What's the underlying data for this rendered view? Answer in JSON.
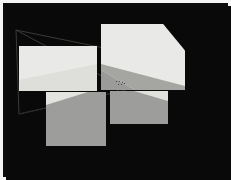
{
  "viewport": {
    "width": 231,
    "height": 180,
    "frame_color": "#f4f4f4",
    "background_color": "#090909"
  },
  "scene": {
    "title": "dark-scene-collage",
    "description": "Dark photographic scene with light and grey rectangular crop panels overlaid in a collage arrangement.",
    "wireframe_color": "#3a3a38"
  },
  "panels": [
    {
      "id": "panel-mid-left",
      "label": "mid-left-light-crop",
      "tone": "light",
      "fill": "#e9e9e7",
      "x": 16,
      "y": 43,
      "width": 78,
      "height": 45,
      "corner": "square"
    },
    {
      "id": "panel-top-right",
      "label": "top-right-light-crop",
      "tone": "light",
      "fill": "#e9e9e7",
      "x": 98,
      "y": 21,
      "width": 84,
      "height": 66,
      "corner": "chamfered-top-right"
    },
    {
      "id": "panel-bottom-left",
      "label": "bottom-left-grey-crop",
      "tone": "grey",
      "fill": "#9d9d9b",
      "x": 43,
      "y": 89,
      "width": 60,
      "height": 54,
      "corner": "square"
    },
    {
      "id": "panel-bottom-right",
      "label": "bottom-right-grey-crop",
      "tone": "grey",
      "fill": "#9d9d9b",
      "x": 107,
      "y": 88,
      "width": 58,
      "height": 33,
      "corner": "square"
    }
  ],
  "wedges": [
    {
      "id": "wedge-mid-left",
      "panel": "panel-mid-left",
      "fill": "#dcdcd8",
      "note": "soft diagonal shading across lower-right of panel"
    },
    {
      "id": "wedge-top-right-grey",
      "panel": "panel-top-right",
      "fill": "#9b9b99",
      "note": "grey triangular wedge entering bottom-left corner"
    },
    {
      "id": "wedge-bottom-left-light",
      "panel": "panel-bottom-left",
      "fill": "#e3e3df",
      "note": "light wedge occupying top-left corner"
    },
    {
      "id": "wedge-bottom-right-light",
      "panel": "panel-bottom-right",
      "fill": "#e0e0dc",
      "note": "light wedge occupying top-right corner"
    }
  ],
  "speckles": {
    "label": "central-marker-dots",
    "color": "#2e2e2e",
    "points": [
      {
        "x": 113,
        "y": 78
      },
      {
        "x": 116,
        "y": 78
      },
      {
        "x": 119,
        "y": 79
      },
      {
        "x": 115,
        "y": 81
      },
      {
        "x": 118,
        "y": 81
      },
      {
        "x": 121,
        "y": 80
      }
    ]
  }
}
